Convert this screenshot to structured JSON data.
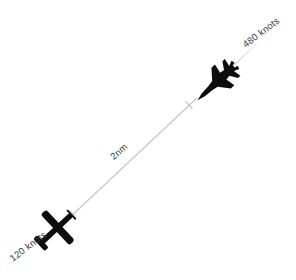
{
  "colors": {
    "background": "#ffffff",
    "line": "#c9c9c9",
    "label_text": "#3a3a3a",
    "aircraft": "#0d0d0d"
  },
  "aircraft": [
    {
      "icon": "fighter-jet-icon",
      "speed_label": "480 knots"
    },
    {
      "icon": "prop-plane-icon",
      "speed_label": "120 knots"
    }
  ],
  "separation": {
    "distance_label": "2nm"
  }
}
